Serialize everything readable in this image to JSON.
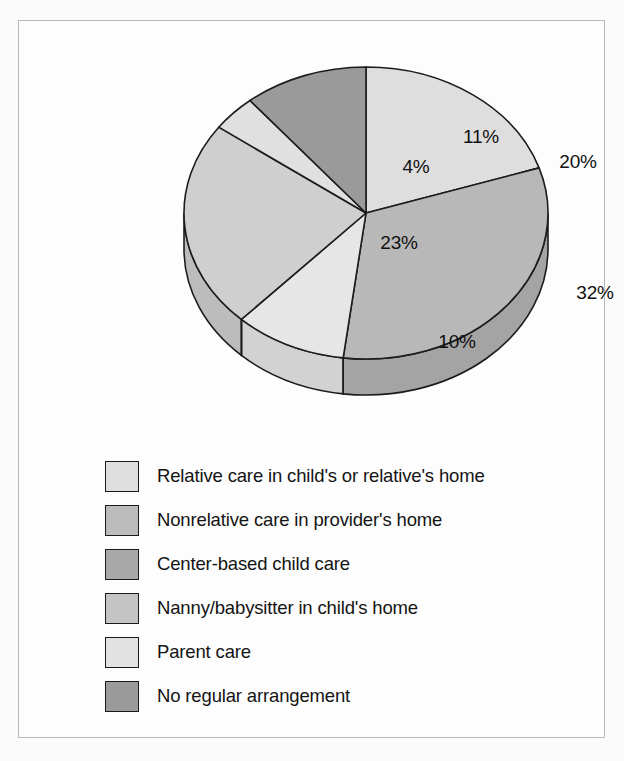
{
  "chart_data": {
    "type": "pie",
    "title": "",
    "subtitle": "",
    "xlabel": "",
    "ylabel": "",
    "legend_position": "bottom-left",
    "grid": false,
    "three_d": true,
    "start_angle_deg": 0,
    "direction": "clockwise",
    "categories": [
      "Relative care in child's or relative's home",
      "Nonrelative care in provider's home",
      "Center-based child care",
      "Nanny/babysitter in child's home",
      "Parent care",
      "No regular arrangement"
    ],
    "values": [
      20,
      32,
      10,
      23,
      4,
      11
    ],
    "data_labels": [
      "20%",
      "32%",
      "10%",
      "23%",
      "4%",
      "11%"
    ],
    "slice_colors": [
      "#dedede",
      "#b8b8b8",
      "#e6e6e6",
      "#cfcfcf",
      "#e0e0e0",
      "#9a9a9a"
    ],
    "side_colors": [
      "#c9c9c9",
      "#a4a4a4",
      "#d2d2d2",
      "#bcbcbc",
      "#cccccc",
      "#8a8a8a"
    ],
    "outline_color": "#1c1c1c",
    "total": 100
  },
  "figure": {
    "frame_color": "#b9b9b9",
    "background": "#fdfdfd"
  },
  "pie": {
    "labels": [
      {
        "text": "20%",
        "x": 409,
        "y": 117
      },
      {
        "text": "32%",
        "x": 426,
        "y": 248
      },
      {
        "text": "10%",
        "x": 288,
        "y": 297
      },
      {
        "text": "23%",
        "x": 230,
        "y": 198
      },
      {
        "text": "4%",
        "x": 247,
        "y": 122
      },
      {
        "text": "11%",
        "x": 312,
        "y": 92
      }
    ]
  },
  "legend": {
    "items": [
      {
        "label": "Relative care in child's or relative's home",
        "color": "#dedede",
        "swatch_name": "legend-swatch-relative-care"
      },
      {
        "label": "Nonrelative care in provider's home",
        "color": "#bcbcbc",
        "swatch_name": "legend-swatch-nonrelative-care"
      },
      {
        "label": "Center-based child care",
        "color": "#a9a9a9",
        "swatch_name": "legend-swatch-center-based"
      },
      {
        "label": "Nanny/babysitter in child's home",
        "color": "#c4c4c4",
        "swatch_name": "legend-swatch-nanny"
      },
      {
        "label": "Parent care",
        "color": "#e2e2e2",
        "swatch_name": "legend-swatch-parent-care"
      },
      {
        "label": "No regular arrangement",
        "color": "#9b9b9b",
        "swatch_name": "legend-swatch-no-arrangement"
      }
    ]
  }
}
